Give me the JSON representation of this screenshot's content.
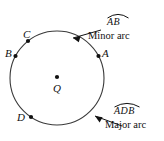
{
  "figure": {
    "type": "circle-arc-diagram",
    "center_label": "Q",
    "points": [
      {
        "label": "A",
        "angle_deg": 28
      },
      {
        "label": "B",
        "angle_deg": 152
      },
      {
        "label": "C",
        "angle_deg": 128
      },
      {
        "label": "D",
        "angle_deg": 237
      }
    ],
    "annotations": [
      {
        "arc_name": "AB",
        "caption": "Minor arc",
        "position": "top-right"
      },
      {
        "arc_name": "ADB",
        "caption": "Major arc",
        "position": "bottom-right"
      }
    ],
    "colors": {
      "stroke": "#3a3a3a",
      "text": "#111111",
      "background": "#ffffff"
    }
  }
}
